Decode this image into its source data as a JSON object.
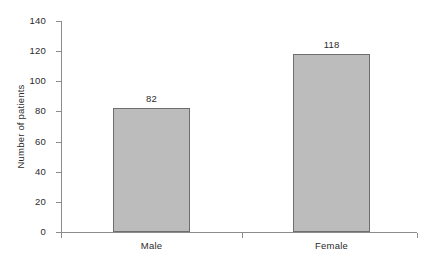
{
  "chart_data": {
    "type": "bar",
    "title": "",
    "xlabel": "",
    "ylabel": "Number of patients",
    "categories": [
      "Male",
      "Female"
    ],
    "values": [
      82,
      118
    ],
    "value_labels": [
      "82",
      "118"
    ],
    "ylim": [
      0,
      140
    ],
    "ytick_labels": [
      "0",
      "20",
      "40",
      "60",
      "80",
      "100",
      "120",
      "140"
    ],
    "ytick_values": [
      0,
      20,
      40,
      60,
      80,
      100,
      120,
      140
    ],
    "grid": false,
    "legend": "none",
    "bar_fill_color": "#bcbcbc",
    "bar_border_color": "#6e6e6e",
    "axis_color": "#8c8c8c",
    "text_color": "#2b2b2b",
    "background_color": "#ffffff"
  }
}
